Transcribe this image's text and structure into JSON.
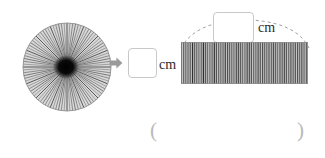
{
  "figure": {
    "type": "rolled-strip-unrolled-diagram",
    "left_shape": {
      "name": "coiled-roll-end-view",
      "shape": "circle",
      "radial_line_count": 96,
      "diameter_px": 90,
      "center_color": "#000000",
      "stripe_color": "#555555"
    },
    "transform_arrow": {
      "icon": "arrow-right-icon",
      "direction": "right",
      "color": "#9a9a9a"
    },
    "right_shape": {
      "name": "unrolled-strip",
      "shape": "rectangle",
      "vertical_stripe_count": 58,
      "width_px": 127,
      "height_px": 42,
      "stripe_color": "#5d5d5d"
    },
    "measurement_arc": {
      "style": "dashed",
      "color": "#a0a0a0",
      "spans": "full-length-of-strip"
    }
  },
  "answers": {
    "diameter_entry": {
      "label": "diameter-answer-box",
      "value": "",
      "placeholder": "",
      "unit": "cm"
    },
    "length_entry": {
      "label": "length-answer-box",
      "value": "",
      "placeholder": "",
      "unit": "cm"
    },
    "final_answer": {
      "label": "final-answer-field",
      "open_paren": "(",
      "close_paren": ")",
      "value": ""
    }
  },
  "colors": {
    "background": "#ffffff",
    "box_border": "#c9c9c9",
    "text": "#2b2b2b",
    "paren": "#b8b8b8",
    "arrow": "#9a9a9a",
    "stripe_dark": "#3a3a3a",
    "stripe_light": "#b5b5b5",
    "arc_dash": "#a0a0a0"
  }
}
